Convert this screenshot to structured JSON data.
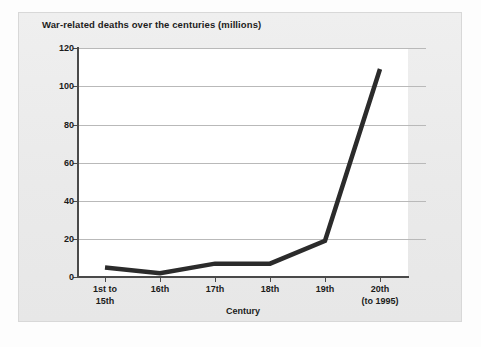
{
  "chart_data": {
    "type": "line",
    "title": "War-related deaths over the centuries (millions)",
    "xlabel": "Century",
    "ylabel": "",
    "categories": [
      "1st to\n15th",
      "16th",
      "17th",
      "18th",
      "19th",
      "20th\n(to 1995)"
    ],
    "values": [
      5,
      2,
      7,
      7,
      19,
      109
    ],
    "series": [
      {
        "name": "War-related deaths (millions)",
        "values": [
          5,
          2,
          7,
          7,
          19,
          109
        ]
      }
    ],
    "ylim": [
      0,
      120
    ],
    "yticks": [
      0,
      20,
      40,
      60,
      80,
      100,
      120
    ],
    "ytick_labels": [
      "0",
      "20",
      "40",
      "60",
      "80",
      "100",
      "120"
    ],
    "grid": true,
    "legend": "none",
    "line_color": "#2b2b2b",
    "plot_background": "#ffffff",
    "panel_background": "#ececec"
  },
  "axis": {
    "y_labels": [
      "120",
      "100",
      "80",
      "60",
      "40",
      "20",
      "0"
    ],
    "x_labels": [
      "1st to\n15th",
      "16th",
      "17th",
      "18th",
      "19th",
      "20th\n(to 1995)"
    ],
    "x_title": "Century"
  }
}
